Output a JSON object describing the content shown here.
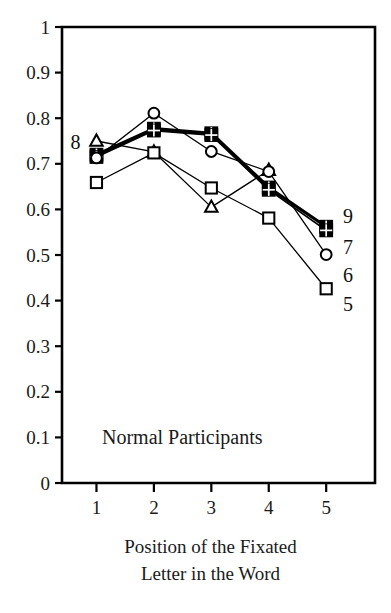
{
  "chart_data": {
    "type": "line",
    "title": "",
    "annotation": "Normal Participants",
    "xlabel_line1": "Position of the Fixated",
    "xlabel_line2": "Letter in the Word",
    "ylabel": "",
    "x": [
      1,
      2,
      3,
      4,
      5
    ],
    "xticklabels": [
      "1",
      "2",
      "3",
      "4",
      "5"
    ],
    "yticklabels": [
      "1",
      "0.9",
      "0.8",
      "0.7",
      "0.6",
      "0.5",
      "0.4",
      "0.3",
      "0.2",
      "0.1",
      "0"
    ],
    "ytickvalues": [
      1,
      0.9,
      0.8,
      0.7,
      0.6,
      0.5,
      0.4,
      0.3,
      0.2,
      0.1,
      0
    ],
    "xlim": [
      0.4,
      5.85
    ],
    "ylim": [
      0,
      1
    ],
    "grid": false,
    "legend_position": "line-end-labels",
    "series": [
      {
        "name": "9",
        "label": "9",
        "marker": "grid-square",
        "linewidth": 3.2,
        "x": [
          1,
          2,
          3,
          4,
          5
        ],
        "values": [
          0.72,
          0.777,
          0.767,
          0.648,
          0.562
        ]
      },
      {
        "name": "8",
        "label": "8",
        "marker": "triangle",
        "linewidth": 1.3,
        "x": [
          1,
          2,
          3,
          4
        ],
        "values": [
          0.75,
          0.726,
          0.605,
          0.686
        ]
      },
      {
        "name": "7",
        "label": "7",
        "marker": "grid-square",
        "linewidth": 1.8,
        "x": [
          1,
          2,
          3,
          4,
          5
        ],
        "values": [
          0.715,
          0.773,
          0.763,
          0.643,
          0.554
        ]
      },
      {
        "name": "6",
        "label": "6",
        "marker": "circle",
        "linewidth": 1.3,
        "x": [
          1,
          2,
          3,
          4,
          5
        ],
        "values": [
          0.713,
          0.811,
          0.727,
          0.683,
          0.501
        ]
      },
      {
        "name": "5",
        "label": "5",
        "marker": "open-square",
        "linewidth": 1.3,
        "x": [
          1,
          2,
          3,
          4,
          5
        ],
        "values": [
          0.659,
          0.724,
          0.647,
          0.581,
          0.426
        ]
      }
    ],
    "left_label": {
      "text": "8",
      "x": 1,
      "y": 0.748
    },
    "series_end_labels": [
      {
        "text": "9",
        "y": 0.585
      },
      {
        "text": "7",
        "y": 0.517
      },
      {
        "text": "6",
        "y": 0.457
      },
      {
        "text": "5",
        "y": 0.392
      }
    ],
    "colors": {
      "ink": "#000000",
      "axis": "#000000",
      "background": "#ffffff"
    }
  }
}
